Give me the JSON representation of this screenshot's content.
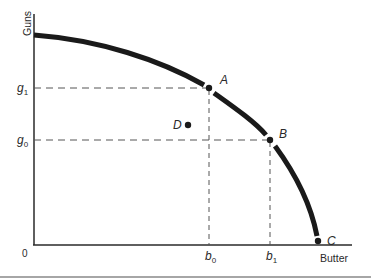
{
  "diagram": {
    "y_axis_label": "Guns",
    "x_axis_label": "Butter",
    "origin_label": "0",
    "y_ticks": [
      {
        "base": "g",
        "sub": "1",
        "y": 88
      },
      {
        "base": "g",
        "sub": "0",
        "y": 140
      }
    ],
    "x_ticks": [
      {
        "base": "b",
        "sub": "0",
        "x": 209
      },
      {
        "base": "b",
        "sub": "1",
        "x": 270
      }
    ],
    "points": [
      {
        "label": "A",
        "on_frontier": true
      },
      {
        "label": "B",
        "on_frontier": true
      },
      {
        "label": "C",
        "on_frontier": true
      },
      {
        "label": "D",
        "on_frontier": false
      }
    ],
    "colors": {
      "curve": "#1a1a1a",
      "axis": "#2a2a2a",
      "dashed": "#555555"
    }
  }
}
